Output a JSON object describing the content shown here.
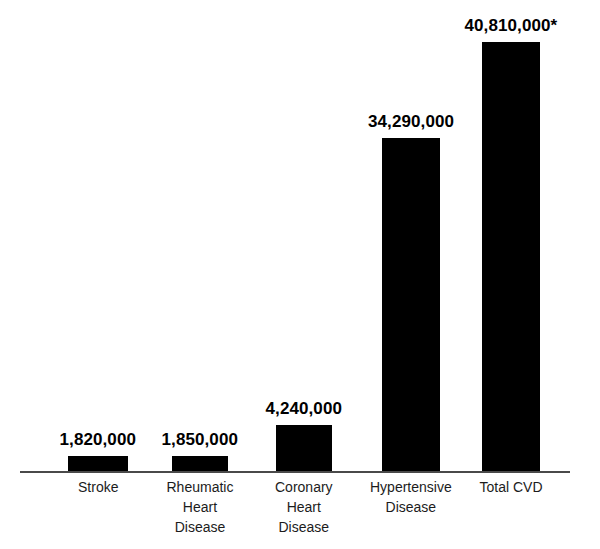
{
  "chart_data": {
    "type": "bar",
    "title": "",
    "subtitle": "",
    "xlabel": "",
    "ylabel": "",
    "grid": false,
    "legend": "none",
    "axis": {
      "x_axis_visible": true,
      "y_axis_visible": false,
      "ylim": [
        0,
        40810000
      ]
    },
    "categories": [
      "Stroke",
      "Rheumatic\nHeart\nDisease",
      "Coronary\nHeart\nDisease",
      "Hypertensive\nDisease",
      "Total CVD"
    ],
    "values": [
      1820000,
      1850000,
      4240000,
      34290000,
      40810000
    ],
    "data_labels": [
      "1,820,000",
      "1,850,000",
      "4,240,000",
      "34,290,000",
      "40,810,000*"
    ],
    "annotations": [
      {
        "text": "*",
        "attached_to": "Total CVD",
        "meaning": "footnote marker on total value"
      }
    ],
    "colors": {
      "bar": "#000000",
      "axis": "#4a4a4a",
      "label": "#000000",
      "background": "#ffffff"
    },
    "bars": [
      {
        "category": "Stroke",
        "label_lines": [
          "Stroke"
        ],
        "value": 1820000,
        "data_label": "1,820,000",
        "x": 68,
        "width": 60,
        "height": 16,
        "label_center": 98
      },
      {
        "category": "Rheumatic Heart Disease",
        "label_lines": [
          "Rheumatic",
          "Heart",
          "Disease"
        ],
        "value": 1850000,
        "data_label": "1,850,000",
        "x": 172,
        "width": 56,
        "height": 16,
        "label_center": 200
      },
      {
        "category": "Coronary Heart Disease",
        "label_lines": [
          "Coronary",
          "Heart",
          "Disease"
        ],
        "value": 4240000,
        "data_label": "4,240,000",
        "x": 276,
        "width": 56,
        "height": 47,
        "label_center": 304
      },
      {
        "category": "Hypertensive Disease",
        "label_lines": [
          "Hypertensive",
          "Disease"
        ],
        "value": 34290000,
        "data_label": "34,290,000",
        "x": 382,
        "width": 58,
        "height": 334,
        "label_center": 411
      },
      {
        "category": "Total CVD",
        "label_lines": [
          "Total CVD"
        ],
        "value": 40810000,
        "data_label": "40,810,000*",
        "x": 482,
        "width": 58,
        "height": 430,
        "label_center": 511
      }
    ]
  }
}
